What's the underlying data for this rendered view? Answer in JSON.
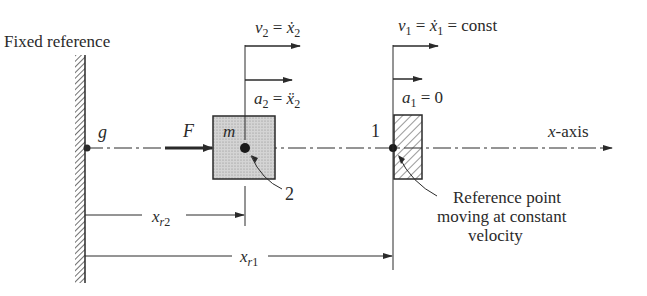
{
  "title": "Fixed reference",
  "labels": {
    "ground_point": "g",
    "force": "F",
    "mass": "m",
    "point_1": "1",
    "point_2": "2",
    "x_axis": "x-axis",
    "v2": "v2 = ẋ2",
    "a2": "a2 = ẍ2",
    "v1": "v1 = ẋ1 = const",
    "a1": "a1 = 0",
    "xr2": "xr2",
    "xr1": "xr1",
    "note_line1": "Reference point",
    "note_line2": "moving at constant",
    "note_line3": "velocity"
  },
  "colors": {
    "ink": "#2a2a2a",
    "mass_fill": "#cfcfcf"
  }
}
